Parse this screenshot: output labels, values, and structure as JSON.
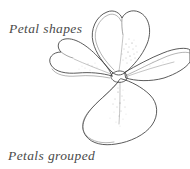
{
  "page": {
    "background_color": "#ffffff",
    "width": 190,
    "height": 169
  },
  "captions": {
    "top": "Petal shapes",
    "bottom": "Petals grouped",
    "color": "#4a4a4a"
  },
  "illustration": {
    "name": "four-petaled-flower-sketch",
    "medium": "pen-and-ink line drawing with stipple shading",
    "ink_color": "#3d3d3d",
    "stipple_color": "#8e8e8e",
    "petal_count": 4,
    "petals": [
      {
        "position": "top",
        "shape": "heart",
        "notched": true
      },
      {
        "position": "left",
        "shape": "heart",
        "notched": true
      },
      {
        "position": "right",
        "shape": "elongated-lobe",
        "notched": false
      },
      {
        "position": "bottom",
        "shape": "rounded-diamond",
        "notched": false
      }
    ],
    "center": "small pentagonal hub where petals converge"
  }
}
